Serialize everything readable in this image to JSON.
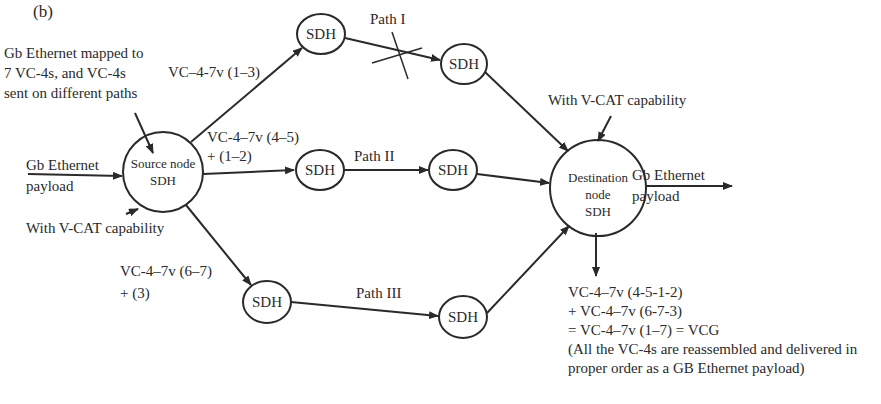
{
  "figure": {
    "panel_label": "(b)"
  },
  "annotations": {
    "mapping_note": [
      "Gb Ethernet mapped to",
      "7 VC-4s, and VC-4s",
      "sent on different paths"
    ],
    "source_capability": "With V-CAT capability",
    "dest_capability": "With V-CAT capability",
    "input_payload": [
      "Gb Ethernet",
      "payload"
    ],
    "output_payload": [
      "Gb Ethernet",
      "payload"
    ],
    "result": [
      "VC-4–7v (4-5-1-2)",
      "+ VC-4–7v (6-7-3)",
      "= VC-4–7v (1–7) = VCG",
      "(All the VC-4s are reassembled and delivered in",
      "proper order as a GB Ethernet payload)"
    ]
  },
  "nodes": {
    "source": [
      "Source node",
      "SDH"
    ],
    "destination": [
      "Destination",
      "node",
      "SDH"
    ],
    "sdh_label": "SDH"
  },
  "paths": [
    {
      "name": "Path I",
      "vc_label": [
        "VC–4-7v (1–3)"
      ],
      "failed": true
    },
    {
      "name": "Path II",
      "vc_label": [
        "VC-4–7v (4–5)",
        "+ (1–2)"
      ],
      "failed": false
    },
    {
      "name": "Path III",
      "vc_label": [
        "VC-4–7v (6–7)",
        "+ (3)"
      ],
      "failed": false
    }
  ],
  "colors": {
    "line": "#2a2a2a",
    "background": "#ffffff"
  }
}
